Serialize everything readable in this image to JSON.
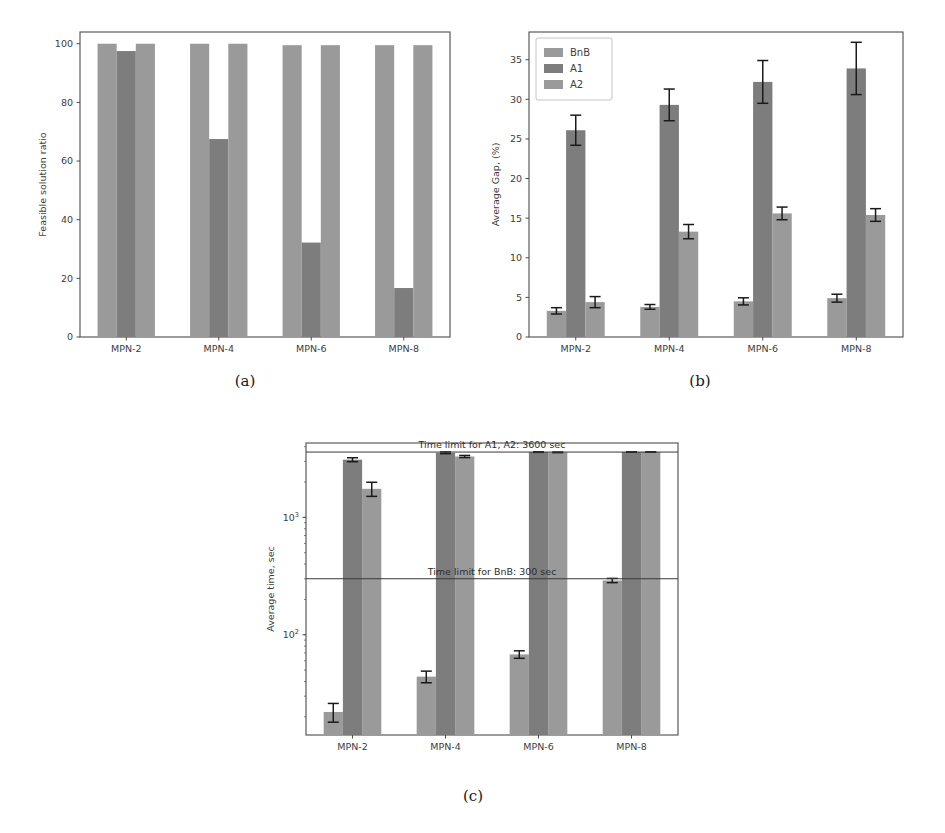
{
  "figure": {
    "background": "#ffffff",
    "series_colors": {
      "BnB": "#9a9a9a",
      "A1": "#7d7d7d",
      "A2": "#9a9a9a"
    },
    "error_color": "#1a1a1a"
  },
  "panels": [
    {
      "id": "a",
      "caption": "(a)",
      "chart_data": {
        "type": "bar",
        "title": "",
        "xlabel": "",
        "ylabel": "Feasible solution ratio",
        "categories": [
          "MPN-2",
          "MPN-4",
          "MPN-6",
          "MPN-8"
        ],
        "series": [
          {
            "name": "BnB",
            "values": [
              100,
              100,
              99.5,
              99.5
            ]
          },
          {
            "name": "A1",
            "values": [
              97.5,
              67.5,
              32.2,
              16.7
            ]
          },
          {
            "name": "A2",
            "values": [
              100,
              100,
              99.5,
              99.5
            ]
          }
        ],
        "yticks": [
          0,
          20,
          40,
          60,
          80,
          100
        ],
        "ylim": [
          0,
          104
        ],
        "grid": false,
        "legend": null,
        "errorbars": false
      }
    },
    {
      "id": "b",
      "caption": "(b)",
      "chart_data": {
        "type": "bar",
        "title": "",
        "xlabel": "",
        "ylabel": "Average Gap, (%)",
        "categories": [
          "MPN-2",
          "MPN-4",
          "MPN-6",
          "MPN-8"
        ],
        "series": [
          {
            "name": "BnB",
            "values": [
              3.3,
              3.8,
              4.5,
              4.9
            ],
            "errors": [
              0.4,
              0.3,
              0.45,
              0.5
            ]
          },
          {
            "name": "A1",
            "values": [
              26.1,
              29.3,
              32.2,
              33.9
            ],
            "errors": [
              1.9,
              2.0,
              2.7,
              3.3
            ]
          },
          {
            "name": "A2",
            "values": [
              4.4,
              13.3,
              15.6,
              15.4
            ],
            "errors": [
              0.7,
              0.9,
              0.8,
              0.8
            ]
          }
        ],
        "yticks": [
          0,
          5,
          10,
          15,
          20,
          25,
          30,
          35
        ],
        "ylim": [
          0,
          38.5
        ],
        "grid": false,
        "legend": {
          "position": "upper-left",
          "entries": [
            "BnB",
            "A1",
            "A2"
          ]
        },
        "errorbars": true
      }
    },
    {
      "id": "c",
      "caption": "(c)",
      "chart_data": {
        "type": "bar",
        "title": "",
        "xlabel": "",
        "ylabel": "Average time, sec",
        "yscale": "log",
        "categories": [
          "MPN-2",
          "MPN-4",
          "MPN-6",
          "MPN-8"
        ],
        "series": [
          {
            "name": "BnB",
            "values": [
              22,
              44,
              68,
              290
            ],
            "errors": [
              4,
              5,
              5,
              12
            ]
          },
          {
            "name": "A1",
            "values": [
              3100,
              3550,
              3600,
              3600
            ],
            "errors": [
              120,
              60,
              20,
              15
            ]
          },
          {
            "name": "A2",
            "values": [
              1750,
              3300,
              3580,
              3600
            ],
            "errors": [
              240,
              70,
              20,
              15
            ]
          }
        ],
        "yticks": [
          100,
          1000
        ],
        "ytick_labels": [
          "10^2",
          "10^3"
        ],
        "ylim": [
          14,
          4300
        ],
        "grid": false,
        "legend": null,
        "errorbars": true,
        "annotations": [
          {
            "text": "Time limit for A1, A2: 3600 sec",
            "y": 3600
          },
          {
            "text": "Time limit for BnB: 300 sec",
            "y": 300
          }
        ]
      }
    }
  ]
}
